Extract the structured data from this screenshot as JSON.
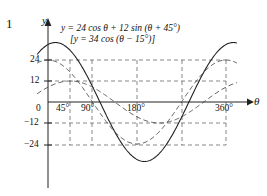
{
  "figure": {
    "problem_number": "1",
    "equation_main": "y = 24 cos θ + 12 sin (θ + 45°)",
    "equation_alt": "[y = 34 cos (θ − 15°)]",
    "axis_label_y": "y",
    "axis_label_x": "θ"
  },
  "ticks": {
    "y": [
      {
        "label": "24",
        "value": 24
      },
      {
        "label": "12",
        "value": 12
      },
      {
        "label": "0",
        "value": 0
      },
      {
        "label": "−12",
        "value": -12
      },
      {
        "label": "−24",
        "value": -24
      }
    ],
    "x": [
      {
        "label": "45°",
        "value": 45
      },
      {
        "label": "90°",
        "value": 90
      },
      {
        "label": "180°",
        "value": 180
      },
      {
        "label": "360°",
        "value": 360
      }
    ]
  },
  "chart_data": {
    "type": "line",
    "title": "y = 24 cos θ + 12 sin (θ + 45°)",
    "subtitle": "[y = 34 cos (θ − 15°)]",
    "xlabel": "θ",
    "ylabel": "y",
    "xlim": [
      -20,
      400
    ],
    "ylim": [
      -40,
      40
    ],
    "x_ticks": [
      45,
      90,
      180,
      360
    ],
    "x_tick_labels": [
      "45°",
      "90°",
      "180°",
      "360°"
    ],
    "y_ticks": [
      24,
      12,
      0,
      -12,
      -24
    ],
    "y_tick_labels": [
      "24",
      "12",
      "0",
      "−12",
      "−24"
    ],
    "grid": true,
    "grid_style": "dashed",
    "legend": "none",
    "series": [
      {
        "name": "resultant",
        "style": "solid",
        "formula": "y = 34 cos (theta - 15)",
        "amplitude": 34,
        "phase_deg": -15,
        "period_deg": 360,
        "x": [
          0,
          15,
          45,
          75,
          90,
          105,
          135,
          165,
          180,
          195,
          225,
          255,
          270,
          285,
          315,
          345,
          360,
          380
        ],
        "y": [
          32.8,
          34,
          29.4,
          17.6,
          8.8,
          0,
          -17,
          -29.4,
          -32.8,
          -34,
          -29.4,
          -17.6,
          -8.8,
          0,
          17,
          29.4,
          32.8,
          33.9
        ]
      },
      {
        "name": "component-24cos",
        "style": "dashed",
        "formula": "y = 24 cos theta",
        "amplitude": 24,
        "phase_deg": 0,
        "period_deg": 360,
        "x": [
          0,
          45,
          90,
          135,
          180,
          225,
          270,
          315,
          360,
          380
        ],
        "y": [
          24,
          17,
          0,
          -17,
          -24,
          -17,
          0,
          17,
          24,
          23.6
        ]
      },
      {
        "name": "component-12sin-shift45",
        "style": "dashed",
        "formula": "y = 12 sin (theta + 45)",
        "amplitude": 12,
        "phase_deg": 45,
        "period_deg": 360,
        "x": [
          0,
          45,
          90,
          135,
          180,
          225,
          270,
          315,
          360,
          380
        ],
        "y": [
          8.5,
          12,
          8.5,
          0,
          -8.5,
          -12,
          -8.5,
          0,
          8.5,
          11.3
        ]
      }
    ]
  }
}
